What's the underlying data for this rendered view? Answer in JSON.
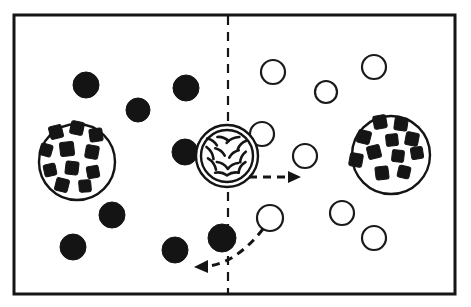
{
  "figure": {
    "background_color": "#ffffff",
    "ink_color": "#141414",
    "frame": {
      "x": 14,
      "y": 15,
      "width": 441,
      "height": 279,
      "stroke_width": 3
    },
    "divider": {
      "name": "membrane-divider",
      "orientation": "vertical",
      "x": 228,
      "y_start": 16,
      "y_end": 293,
      "style": "dashed"
    }
  },
  "particles": {
    "filled": {
      "label": "filled-particle",
      "fill": "#141414",
      "radius": 13,
      "items": [
        {
          "cx": 86,
          "cy": 85,
          "r": 13
        },
        {
          "cx": 138,
          "cy": 110,
          "r": 12
        },
        {
          "cx": 186,
          "cy": 88,
          "r": 13
        },
        {
          "cx": 185,
          "cy": 152,
          "r": 13
        },
        {
          "cx": 112,
          "cy": 215,
          "r": 13
        },
        {
          "cx": 73,
          "cy": 247,
          "r": 13
        },
        {
          "cx": 175,
          "cy": 250,
          "r": 13
        },
        {
          "cx": 222,
          "cy": 238,
          "r": 14
        }
      ]
    },
    "open": {
      "label": "open-particle",
      "fill": "#ffffff",
      "stroke": "#1a1a1a",
      "radius": 11,
      "items": [
        {
          "cx": 273,
          "cy": 72,
          "r": 12
        },
        {
          "cx": 326,
          "cy": 92,
          "r": 11
        },
        {
          "cx": 374,
          "cy": 67,
          "r": 12
        },
        {
          "cx": 262,
          "cy": 134,
          "r": 12
        },
        {
          "cx": 305,
          "cy": 156,
          "r": 12
        },
        {
          "cx": 270,
          "cy": 218,
          "r": 13
        },
        {
          "cx": 342,
          "cy": 213,
          "r": 12
        },
        {
          "cx": 374,
          "cy": 238,
          "r": 12
        }
      ]
    }
  },
  "vesicles": [
    {
      "name": "left-loaded-vesicle",
      "cx": 77,
      "cy": 162,
      "r": 38,
      "double_ring": false,
      "cargo_count": 11,
      "cargo": [
        {
          "x": 56,
          "y": 132,
          "s": 13,
          "rot": -14
        },
        {
          "x": 77,
          "y": 128,
          "s": 13,
          "rot": 12
        },
        {
          "x": 96,
          "y": 135,
          "s": 13,
          "rot": -8
        },
        {
          "x": 46,
          "y": 150,
          "s": 12,
          "rot": 16
        },
        {
          "x": 67,
          "y": 149,
          "s": 14,
          "rot": -6
        },
        {
          "x": 92,
          "y": 152,
          "s": 13,
          "rot": 10
        },
        {
          "x": 50,
          "y": 170,
          "s": 12,
          "rot": -12
        },
        {
          "x": 72,
          "y": 168,
          "s": 13,
          "rot": 7
        },
        {
          "x": 93,
          "y": 172,
          "s": 12,
          "rot": -10
        },
        {
          "x": 62,
          "y": 185,
          "s": 13,
          "rot": 14
        },
        {
          "x": 85,
          "y": 186,
          "s": 12,
          "rot": -5
        }
      ]
    },
    {
      "name": "right-loaded-vesicle",
      "cx": 391,
      "cy": 155,
      "r": 39,
      "double_ring": false,
      "cargo_count": 11,
      "cargo": [
        {
          "x": 380,
          "y": 122,
          "s": 13,
          "rot": -10
        },
        {
          "x": 401,
          "y": 124,
          "s": 13,
          "rot": 8
        },
        {
          "x": 364,
          "y": 137,
          "s": 13,
          "rot": 14
        },
        {
          "x": 392,
          "y": 140,
          "s": 12,
          "rot": -6
        },
        {
          "x": 412,
          "y": 139,
          "s": 13,
          "rot": 11
        },
        {
          "x": 374,
          "y": 152,
          "s": 13,
          "rot": -14
        },
        {
          "x": 398,
          "y": 156,
          "s": 12,
          "rot": 6
        },
        {
          "x": 417,
          "y": 153,
          "s": 12,
          "rot": -9
        },
        {
          "x": 356,
          "y": 160,
          "s": 13,
          "rot": 10
        },
        {
          "x": 382,
          "y": 173,
          "s": 13,
          "rot": -7
        },
        {
          "x": 404,
          "y": 172,
          "s": 12,
          "rot": 13
        }
      ]
    }
  ],
  "transporter": {
    "name": "membrane-transporter",
    "cx": 227,
    "cy": 156,
    "r_outer": 31,
    "r_inner": 26,
    "double_ring": true,
    "mix_stroke_count": 14,
    "description": "double-ringed mixing body straddling the divider"
  },
  "arrows": [
    {
      "name": "efflux-arrow",
      "direction": "right",
      "style": "dashed",
      "path": "M 249 177 L 296 177",
      "head": "301,177 288,171 288,183"
    },
    {
      "name": "influx-arrow",
      "direction": "down-left",
      "style": "dashed-curved",
      "path": "M 263 229 C 245 252 224 266 205 266",
      "head": "194,267 208,260 208,273"
    }
  ],
  "legend_counts": {
    "filled_particles_left": 8,
    "open_particles_right": 8,
    "vesicles": 3,
    "arrows": 2
  }
}
